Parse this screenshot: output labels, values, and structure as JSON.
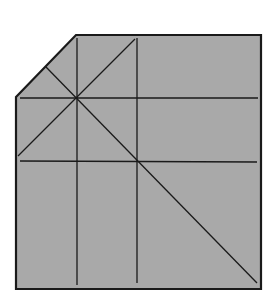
{
  "diagram": {
    "type": "origami-crease-pattern",
    "paper_color": "#a9a9a9",
    "line_color": "#1a1a1a",
    "outline": {
      "points": [
        [
          16,
          97
        ],
        [
          76,
          35
        ],
        [
          261,
          35
        ],
        [
          261,
          289
        ],
        [
          16,
          289
        ]
      ],
      "stroke_width": 2.2
    },
    "creases": [
      {
        "name": "vertical-left",
        "x1": 77,
        "y1": 38,
        "x2": 77,
        "y2": 285
      },
      {
        "name": "vertical-right",
        "x1": 137,
        "y1": 38,
        "x2": 137,
        "y2": 283
      },
      {
        "name": "horizontal-top",
        "x1": 20,
        "y1": 98,
        "x2": 258,
        "y2": 98
      },
      {
        "name": "horizontal-bottom",
        "x1": 20,
        "y1": 161,
        "x2": 257,
        "y2": 162
      },
      {
        "name": "diagonal-up",
        "x1": 18,
        "y1": 156,
        "x2": 135,
        "y2": 39
      },
      {
        "name": "diagonal-down",
        "x1": 46,
        "y1": 67,
        "x2": 257,
        "y2": 283
      }
    ],
    "crease_width": 1.3
  }
}
